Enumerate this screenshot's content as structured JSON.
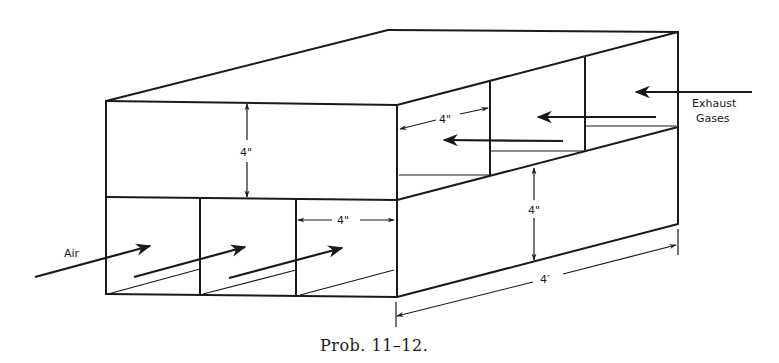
{
  "figure": {
    "caption": "Prob. 11–12."
  },
  "labels": {
    "air": "Air",
    "exhaust_line1": "Exhaust",
    "exhaust_line2": "Gases"
  },
  "dimensions": {
    "upper_channel_height": "4\"",
    "lower_channel_width": "4\"",
    "upper_channel_width": "4\"",
    "side_channel_height": "4\"",
    "length": "4′"
  },
  "flows": [
    {
      "name": "air",
      "direction": "into lower channels, front to back"
    },
    {
      "name": "exhaust gases",
      "direction": "into upper channels, right to left"
    }
  ]
}
